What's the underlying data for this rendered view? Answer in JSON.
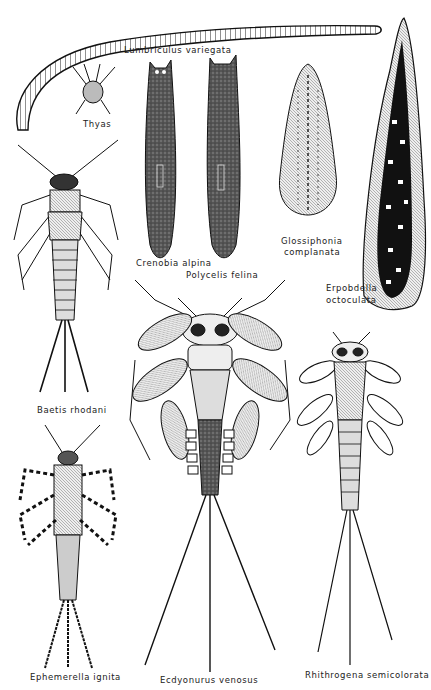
{
  "plate": {
    "background": "#ffffff",
    "ink": "#1a1a1a",
    "specimens": [
      {
        "id": "lumbriculus",
        "label": "Lumbriculus variegata"
      },
      {
        "id": "thyas",
        "label": "Thyas"
      },
      {
        "id": "crenobia",
        "label": "Crenobia alpina"
      },
      {
        "id": "polycelis",
        "label": "Polycelis felina"
      },
      {
        "id": "glossiphonia",
        "label_line1": "Glossiphonia",
        "label_line2": "complanata"
      },
      {
        "id": "erpobdella",
        "label_line1": "Erpobdella",
        "label_line2": "octoculata"
      },
      {
        "id": "baetis",
        "label": "Baetis rhodani"
      },
      {
        "id": "ephemerella",
        "label": "Ephemerella ignita"
      },
      {
        "id": "ecdyonurus",
        "label": "Ecdyonurus venosus"
      },
      {
        "id": "rhithrogena",
        "label": "Rhithrogena semicolorata"
      }
    ]
  }
}
